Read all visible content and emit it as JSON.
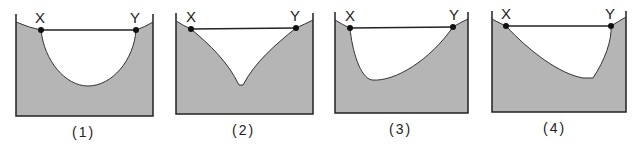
{
  "colors": {
    "fill": "#b5b5b5",
    "stroke": "#222222",
    "background": "#ffffff"
  },
  "panels": [
    {
      "label": "(1)",
      "point_left": "X",
      "point_right": "Y",
      "shape": "symmetric U-shaped cross-section"
    },
    {
      "label": "(2)",
      "point_left": "X",
      "point_right": "Y",
      "shape": "symmetric V-shaped cross-section"
    },
    {
      "label": "(3)",
      "point_left": "X",
      "point_right": "Y",
      "shape": "asymmetric, deepest near X"
    },
    {
      "label": "(4)",
      "point_left": "X",
      "point_right": "Y",
      "shape": "asymmetric, deepest near Y"
    }
  ]
}
